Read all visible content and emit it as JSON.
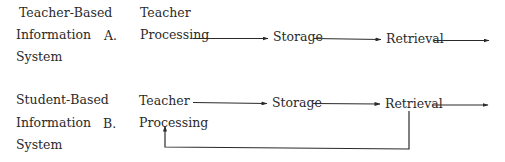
{
  "systems": [
    {
      "label_lines": [
        "Teacher-Based",
        "Information",
        "System"
      ],
      "marker": "A.",
      "flow": {
        "start_lines": [
          "Teacher",
          "Processing"
        ],
        "steps": [
          "Storage",
          "Retrieval"
        ],
        "feedback": false
      }
    },
    {
      "label_lines": [
        "Student-Based",
        "Information",
        "System"
      ],
      "marker": "B.",
      "flow": {
        "start_lines": [
          "Teacher",
          "Processing"
        ],
        "steps": [
          "Storage",
          "Retrieval"
        ],
        "feedback": true,
        "feedback_from": "Retrieval",
        "feedback_to": "Processing"
      }
    }
  ],
  "colors": {
    "text": "#2a2a2a",
    "lines": "#2a2a2a",
    "background": "#ffffff"
  }
}
